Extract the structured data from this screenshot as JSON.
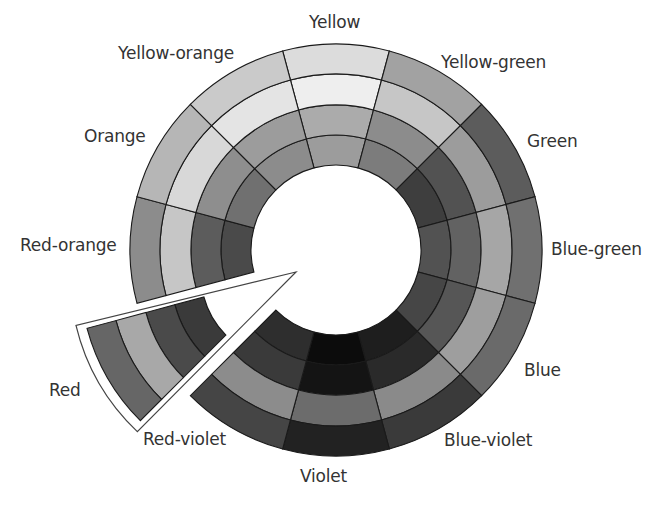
{
  "diagram": {
    "center": [
      336,
      250
    ],
    "ring_radii": [
      85,
      115,
      145,
      176,
      206
    ],
    "ring_order": [
      "inner-shade",
      "tone",
      "tint",
      "pure-hue-outer"
    ],
    "exploded_segment": "Red",
    "exploded_center": [
      286,
      275
    ],
    "pointer_tip": [
      296,
      272
    ],
    "segments": [
      {
        "name": "Yellow",
        "angle": 270,
        "colors": {
          "outer": "#dcdcdc",
          "tint": "#eeeeee",
          "tone": "#ababab",
          "shade": "#9c9c9c"
        }
      },
      {
        "name": "Yellow-green",
        "angle": 300,
        "colors": {
          "outer": "#a2a2a2",
          "tint": "#c6c6c6",
          "tone": "#8c8c8c",
          "shade": "#7c7c7c"
        }
      },
      {
        "name": "Green",
        "angle": 330,
        "colors": {
          "outer": "#5c5c5c",
          "tint": "#9c9c9c",
          "tone": "#525252",
          "shade": "#3e3e3e"
        }
      },
      {
        "name": "Blue-green",
        "angle": 0,
        "colors": {
          "outer": "#707070",
          "tint": "#a6a6a6",
          "tone": "#626262",
          "shade": "#525252"
        }
      },
      {
        "name": "Blue",
        "angle": 30,
        "colors": {
          "outer": "#6a6a6a",
          "tint": "#9e9e9e",
          "tone": "#565656",
          "shade": "#464646"
        }
      },
      {
        "name": "Blue-violet",
        "angle": 60,
        "colors": {
          "outer": "#3a3a3a",
          "tint": "#8a8a8a",
          "tone": "#2a2a2a",
          "shade": "#1e1e1e"
        }
      },
      {
        "name": "Violet",
        "angle": 90,
        "colors": {
          "outer": "#222222",
          "tint": "#6c6c6c",
          "tone": "#141414",
          "shade": "#0c0c0c"
        }
      },
      {
        "name": "Red-violet",
        "angle": 120,
        "colors": {
          "outer": "#454545",
          "tint": "#8c8c8c",
          "tone": "#3a3a3a",
          "shade": "#2e2e2e"
        }
      },
      {
        "name": "Red",
        "angle": 150,
        "colors": {
          "outer": "#666666",
          "tint": "#a8a8a8",
          "tone": "#4a4a4a",
          "shade": "#3a3a3a"
        }
      },
      {
        "name": "Red-orange",
        "angle": 180,
        "colors": {
          "outer": "#8c8c8c",
          "tint": "#c6c6c6",
          "tone": "#5c5c5c",
          "shade": "#4a4a4a"
        }
      },
      {
        "name": "Orange",
        "angle": 210,
        "colors": {
          "outer": "#b6b6b6",
          "tint": "#d8d8d8",
          "tone": "#8e8e8e",
          "shade": "#707070"
        }
      },
      {
        "name": "Yellow-orange",
        "angle": 240,
        "colors": {
          "outer": "#cacaca",
          "tint": "#e4e4e4",
          "tone": "#9c9c9c",
          "shade": "#8c8c8c"
        }
      }
    ]
  },
  "labels": {
    "yellow": "Yellow",
    "yellow_orange": "Yellow-orange",
    "yellow_green": "Yellow-green",
    "orange": "Orange",
    "green": "Green",
    "red_orange": "Red-orange",
    "blue_green": "Blue-green",
    "red": "Red",
    "blue": "Blue",
    "red_violet": "Red-violet",
    "blue_violet": "Blue-violet",
    "violet": "Violet"
  },
  "colors": {
    "background": "#ffffff",
    "stroke": "#1a1a1a",
    "label_text": "#333333"
  }
}
